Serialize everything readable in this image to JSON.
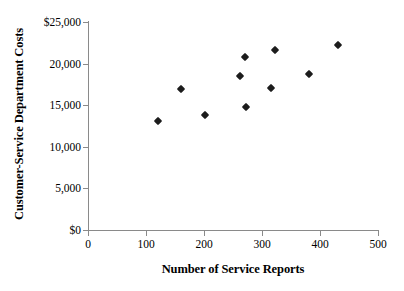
{
  "chart_data": {
    "type": "scatter",
    "title": "",
    "xlabel": "Number of Service Reports",
    "ylabel": "Customer-Service Department Costs",
    "xlim": [
      0,
      500
    ],
    "ylim": [
      0,
      25000
    ],
    "grid": false,
    "legend": null,
    "x_ticks": [
      "0",
      "100",
      "200",
      "300",
      "400",
      "500"
    ],
    "x_tick_values": [
      0,
      100,
      200,
      300,
      400,
      500
    ],
    "y_ticks": [
      "$0",
      "5,000",
      "10,000",
      "15,000",
      "20,000",
      "$25,000"
    ],
    "y_tick_values": [
      0,
      5000,
      10000,
      15000,
      20000,
      25000
    ],
    "marker": "diamond",
    "marker_color": "#1c1c1c",
    "points": [
      {
        "x": 121,
        "y": 13100
      },
      {
        "x": 160,
        "y": 16950
      },
      {
        "x": 202,
        "y": 13820
      },
      {
        "x": 262,
        "y": 18460
      },
      {
        "x": 271,
        "y": 20790
      },
      {
        "x": 272,
        "y": 14780
      },
      {
        "x": 316,
        "y": 17070
      },
      {
        "x": 322,
        "y": 21630
      },
      {
        "x": 381,
        "y": 18750
      },
      {
        "x": 431,
        "y": 22240
      }
    ]
  },
  "axes": {
    "axis_color": "#8a8a8a"
  }
}
